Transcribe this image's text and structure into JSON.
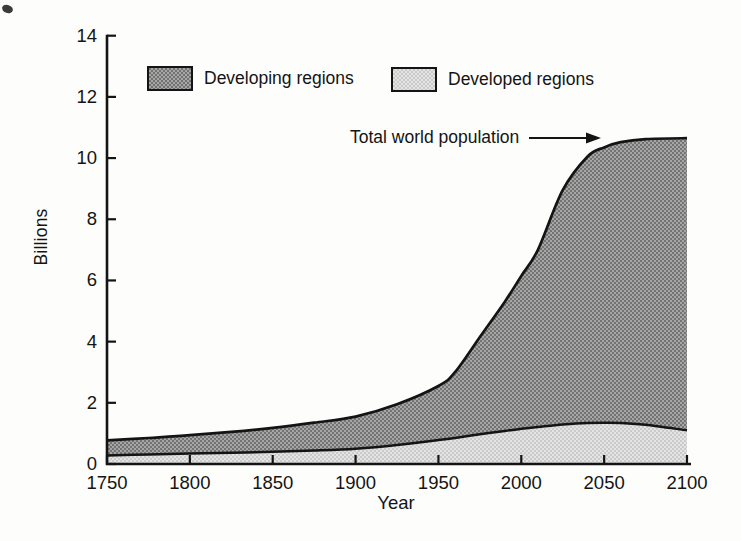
{
  "chart_data": {
    "type": "area",
    "title": "",
    "xlabel": "Year",
    "ylabel": "Billions",
    "xlim": [
      1750,
      2100
    ],
    "ylim": [
      0,
      14
    ],
    "grid": false,
    "x_ticks": [
      1750,
      1800,
      1850,
      1900,
      1950,
      2000,
      2050,
      2100
    ],
    "y_ticks": [
      0,
      2,
      4,
      6,
      8,
      10,
      12,
      14
    ],
    "x": [
      1750,
      1775,
      1800,
      1825,
      1850,
      1875,
      1900,
      1925,
      1950,
      1960,
      1975,
      1990,
      2000,
      2010,
      2025,
      2040,
      2050,
      2060,
      2075,
      2100
    ],
    "series": [
      {
        "name": "Total world population",
        "role": "total",
        "values": [
          0.77,
          0.85,
          0.94,
          1.05,
          1.18,
          1.35,
          1.55,
          1.95,
          2.55,
          3.0,
          4.15,
          5.3,
          6.15,
          7.0,
          8.95,
          10.05,
          10.35,
          10.52,
          10.62,
          10.65
        ],
        "line_color": "#141414"
      },
      {
        "name": "Developed regions",
        "role": "developed",
        "values": [
          0.28,
          0.31,
          0.34,
          0.37,
          0.4,
          0.44,
          0.5,
          0.62,
          0.78,
          0.85,
          0.97,
          1.08,
          1.15,
          1.21,
          1.29,
          1.34,
          1.35,
          1.34,
          1.28,
          1.1
        ],
        "fill": "light-halftone",
        "avg_fill_color": "#d7d7d7",
        "line_color": "#141414"
      }
    ],
    "bands": [
      {
        "name": "Developing regions",
        "between": [
          "Developed regions",
          "Total world population"
        ],
        "fill": "dark-halftone",
        "avg_fill_color": "#8d8d8d"
      }
    ],
    "legend": [
      {
        "label": "Developing regions",
        "swatch": "dark-halftone"
      },
      {
        "label": "Developed regions",
        "swatch": "light-halftone"
      }
    ],
    "annotation": {
      "text": "Total world population",
      "icon": "arrow-right",
      "points_to_value": 10.65
    }
  }
}
